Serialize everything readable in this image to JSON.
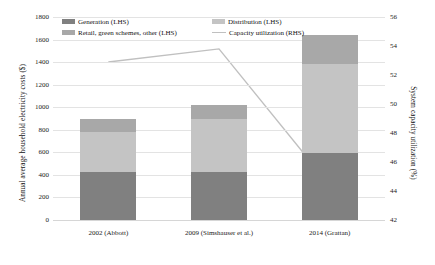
{
  "chart_data": {
    "type": "bar",
    "title": "",
    "subtitle": "",
    "xlabel": "",
    "ylabel": "Annual average household electricity costs ($)",
    "ylabel_right": "System capacity utilization (%)",
    "categories": [
      "2002 (Abbott)",
      "2009 (Simshauser et al.)",
      "2014 (Grattan)"
    ],
    "ylim": [
      0,
      1800
    ],
    "yticks": [
      0,
      200,
      400,
      600,
      800,
      1000,
      1200,
      1400,
      1600,
      1800
    ],
    "ylim_right": [
      42,
      56
    ],
    "yticks_right": [
      42,
      44,
      46,
      48,
      50,
      52,
      54,
      56
    ],
    "grid": true,
    "legend_position": "top-inside",
    "stacked": true,
    "series": [
      {
        "name": "Generation (LHS)",
        "axis": "left",
        "type": "bar",
        "color": "#808080",
        "values": [
          430,
          430,
          590
        ]
      },
      {
        "name": "Distribution (LHS)",
        "axis": "left",
        "type": "bar",
        "color": "#c4c4c4",
        "values": [
          350,
          470,
          790
        ]
      },
      {
        "name": "Retail, green schemes, other (LHS)",
        "axis": "left",
        "type": "bar",
        "color": "#a8a8a8",
        "values": [
          120,
          120,
          260
        ]
      },
      {
        "name": "Capacity utilization (RHS)",
        "axis": "right",
        "type": "line",
        "color": "#c0c0c0",
        "values": [
          52.9,
          53.8,
          44.4
        ]
      }
    ],
    "totals": [
      900,
      1020,
      1640
    ]
  },
  "axes": {
    "left_title": "Annual average household electricity costs ($)",
    "right_title": "System capacity utilization (%)",
    "left_ticks": [
      "1800",
      "1600",
      "1400",
      "1200",
      "1000",
      "800",
      "600",
      "400",
      "200",
      "0"
    ],
    "right_ticks": [
      "56",
      "54",
      "52",
      "50",
      "48",
      "46",
      "44",
      "42"
    ],
    "x_ticks": [
      "2002 (Abbott)",
      "2009 (Simshauser et al.)",
      "2014 (Grattan)"
    ]
  },
  "legend": {
    "items": [
      {
        "label": "Generation (LHS)",
        "marker": "swatch-generation",
        "color": "#808080"
      },
      {
        "label": "Distribution (LHS)",
        "marker": "swatch-distribution",
        "color": "#c4c4c4"
      },
      {
        "label": "Retail, green schemes, other (LHS)",
        "marker": "swatch-retail",
        "color": "#a8a8a8"
      },
      {
        "label": "Capacity utilization (RHS)",
        "marker": "line-capacity",
        "color": "#c0c0c0"
      }
    ]
  }
}
